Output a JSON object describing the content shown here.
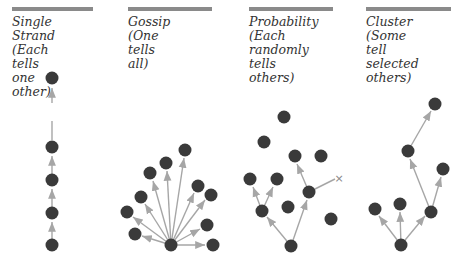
{
  "colors": {
    "node": "#3a3a3a",
    "edge": "#a6a6a6",
    "bar": "#8a8a8a",
    "text": "#333333"
  },
  "panels": [
    {
      "title": "Single Strand",
      "subtitle": "(Each tells\none other)"
    },
    {
      "title": "Gossip",
      "subtitle": "(One tells all)"
    },
    {
      "title": "Probability",
      "subtitle": "(Each randomly\ntells others)"
    },
    {
      "title": "Cluster",
      "subtitle": "(Some tell\nselected others)"
    }
  ],
  "labels": {
    "p0": "Single Strand\n(Each tells\none other)",
    "p1": "Gossip\n(One tells all)",
    "p2": "Probability\n(Each randomly\ntells others)",
    "p3": "Cluster\n(Some tell\nselected others)"
  },
  "terminated_marker": "×"
}
